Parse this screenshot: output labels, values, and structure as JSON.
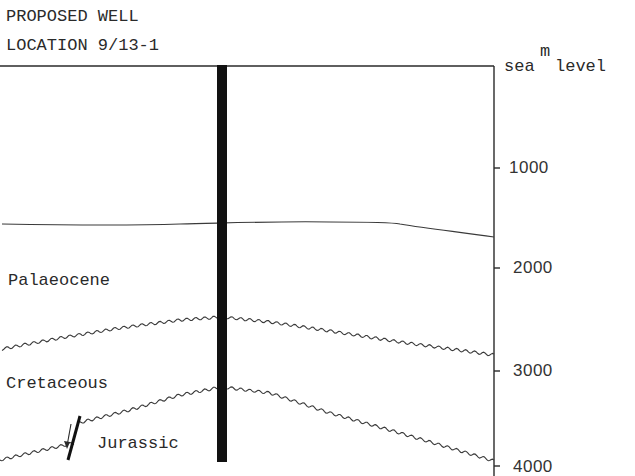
{
  "title": {
    "line1": "PROPOSED WELL",
    "line2": "LOCATION 9/13-1"
  },
  "axis": {
    "unit": "m",
    "datum_label": "sea  level",
    "ticks": [
      {
        "value": 1000,
        "label": "1000"
      },
      {
        "value": 2000,
        "label": "2000"
      },
      {
        "value": 3000,
        "label": "3000"
      },
      {
        "value": 4000,
        "label": "4000"
      }
    ]
  },
  "formations": [
    {
      "name": "Palaeocene"
    },
    {
      "name": "Cretaceous"
    },
    {
      "name": "Jurassic"
    }
  ],
  "features": {
    "well": "proposed-well-bore",
    "fault": "normal-fault-with-arrow",
    "horizons": [
      "top-palaeocene",
      "base-palaeocene-unconformity",
      "base-cretaceous-unconformity"
    ]
  },
  "colors": {
    "ink": "#2a2a2a",
    "well": "#111111",
    "background": "#ffffff"
  }
}
